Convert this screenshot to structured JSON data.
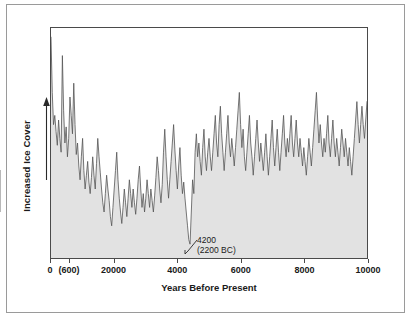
{
  "figure": {
    "background_color": "#ffffff",
    "border_color": "#9a9a9a"
  },
  "axes": {
    "frame_color": "#4a4a4a",
    "y": {
      "label": "Increased Ice Cover",
      "arrow_direction": "up",
      "arrow_icon": "up-arrow-icon"
    },
    "x": {
      "label": "Years Before Present",
      "tick_labels": [
        "0",
        "(600)",
        "20000",
        "4000",
        "6000",
        "8000",
        "10000"
      ],
      "tick_values": [
        0,
        600,
        2000,
        4000,
        6000,
        8000,
        10000
      ]
    }
  },
  "annotations": [
    {
      "name": "event-4200",
      "line1": "4200",
      "line2": "(2200 BC)",
      "points_to_x": 4200
    }
  ],
  "chart_data": {
    "type": "area",
    "title": "",
    "subtitle": "",
    "xlabel": "Years Before Present",
    "ylabel": "Increased Ice Cover",
    "xlim": [
      0,
      10000
    ],
    "ylim": [
      0,
      100
    ],
    "grid": false,
    "legend": null,
    "fill_color": "#e2e2e2",
    "line_color": "#555555",
    "line_width": 0.8,
    "x_tick_labels": [
      "0",
      "(600)",
      "20000",
      "4000",
      "6000",
      "8000",
      "10000"
    ],
    "x_tick_values": [
      0,
      600,
      2000,
      4000,
      6000,
      8000,
      10000
    ],
    "y_axis_ticks_shown": false,
    "x": [
      0,
      40,
      80,
      120,
      160,
      200,
      240,
      280,
      320,
      360,
      400,
      440,
      480,
      520,
      560,
      600,
      640,
      680,
      720,
      760,
      800,
      840,
      880,
      920,
      960,
      1000,
      1040,
      1080,
      1120,
      1160,
      1200,
      1240,
      1280,
      1320,
      1360,
      1400,
      1440,
      1480,
      1520,
      1560,
      1600,
      1640,
      1680,
      1720,
      1760,
      1800,
      1840,
      1880,
      1920,
      1960,
      2000,
      2040,
      2080,
      2120,
      2160,
      2200,
      2240,
      2280,
      2320,
      2360,
      2400,
      2440,
      2480,
      2520,
      2560,
      2600,
      2640,
      2680,
      2720,
      2760,
      2800,
      2840,
      2880,
      2920,
      2960,
      3000,
      3040,
      3080,
      3120,
      3160,
      3200,
      3240,
      3280,
      3320,
      3360,
      3400,
      3440,
      3480,
      3520,
      3560,
      3600,
      3640,
      3680,
      3720,
      3760,
      3800,
      3840,
      3880,
      3920,
      3960,
      4000,
      4040,
      4080,
      4120,
      4160,
      4200,
      4240,
      4280,
      4320,
      4360,
      4400,
      4440,
      4480,
      4520,
      4560,
      4600,
      4640,
      4680,
      4720,
      4760,
      4800,
      4840,
      4880,
      4920,
      4960,
      5000,
      5040,
      5080,
      5120,
      5160,
      5200,
      5240,
      5280,
      5320,
      5360,
      5400,
      5440,
      5480,
      5520,
      5560,
      5600,
      5640,
      5680,
      5720,
      5760,
      5800,
      5840,
      5880,
      5920,
      5960,
      6000,
      6040,
      6080,
      6120,
      6160,
      6200,
      6240,
      6280,
      6320,
      6360,
      6400,
      6440,
      6480,
      6520,
      6560,
      6600,
      6640,
      6680,
      6720,
      6760,
      6800,
      6840,
      6880,
      6920,
      6960,
      7000,
      7040,
      7080,
      7120,
      7160,
      7200,
      7240,
      7280,
      7320,
      7360,
      7400,
      7440,
      7480,
      7520,
      7560,
      7600,
      7640,
      7680,
      7720,
      7760,
      7800,
      7840,
      7880,
      7920,
      7960,
      8000,
      8040,
      8080,
      8120,
      8160,
      8200,
      8240,
      8280,
      8320,
      8360,
      8400,
      8440,
      8480,
      8520,
      8560,
      8600,
      8640,
      8680,
      8720,
      8760,
      8800,
      8840,
      8880,
      8920,
      8960,
      9000,
      9040,
      9080,
      9120,
      9160,
      9200,
      9240,
      9280,
      9320,
      9360,
      9400,
      9440,
      9480,
      9520,
      9560,
      9600,
      9640,
      9680,
      9720,
      9760,
      9800,
      9840,
      9880,
      9920,
      9960,
      10000
    ],
    "y": [
      96,
      72,
      58,
      62,
      55,
      49,
      60,
      52,
      46,
      88,
      64,
      50,
      57,
      44,
      52,
      70,
      62,
      54,
      76,
      58,
      45,
      50,
      40,
      34,
      44,
      52,
      38,
      30,
      36,
      42,
      33,
      28,
      35,
      44,
      36,
      30,
      41,
      52,
      44,
      37,
      30,
      24,
      20,
      28,
      36,
      30,
      25,
      18,
      14,
      22,
      30,
      38,
      46,
      34,
      26,
      20,
      15,
      22,
      30,
      24,
      18,
      26,
      34,
      28,
      22,
      30,
      24,
      19,
      26,
      34,
      40,
      30,
      22,
      28,
      20,
      26,
      34,
      28,
      22,
      30,
      25,
      20,
      27,
      35,
      44,
      38,
      30,
      24,
      32,
      46,
      56,
      44,
      34,
      26,
      34,
      42,
      50,
      58,
      47,
      38,
      30,
      40,
      48,
      36,
      28,
      33,
      26,
      20,
      14,
      8,
      6,
      20,
      34,
      28,
      46,
      54,
      44,
      50,
      42,
      36,
      48,
      56,
      44,
      38,
      46,
      52,
      44,
      38,
      46,
      54,
      62,
      50,
      44,
      58,
      66,
      54,
      46,
      38,
      46,
      54,
      62,
      50,
      44,
      52,
      46,
      40,
      48,
      56,
      64,
      72,
      58,
      48,
      56,
      44,
      38,
      46,
      54,
      62,
      50,
      44,
      36,
      44,
      52,
      60,
      50,
      42,
      50,
      44,
      38,
      46,
      54,
      44,
      36,
      44,
      52,
      60,
      48,
      40,
      48,
      56,
      46,
      38,
      46,
      54,
      62,
      50,
      44,
      52,
      46,
      54,
      62,
      50,
      44,
      52,
      60,
      50,
      44,
      52,
      46,
      40,
      48,
      42,
      36,
      44,
      52,
      46,
      40,
      48,
      56,
      64,
      72,
      60,
      50,
      58,
      50,
      44,
      52,
      46,
      54,
      62,
      50,
      44,
      52,
      60,
      50,
      44,
      52,
      46,
      40,
      48,
      56,
      50,
      44,
      52,
      46,
      40,
      48,
      42,
      36,
      44,
      52,
      60,
      68,
      58,
      50,
      58,
      66,
      58,
      52,
      60,
      68,
      76,
      66,
      58,
      66,
      60,
      54,
      62,
      56
    ]
  }
}
